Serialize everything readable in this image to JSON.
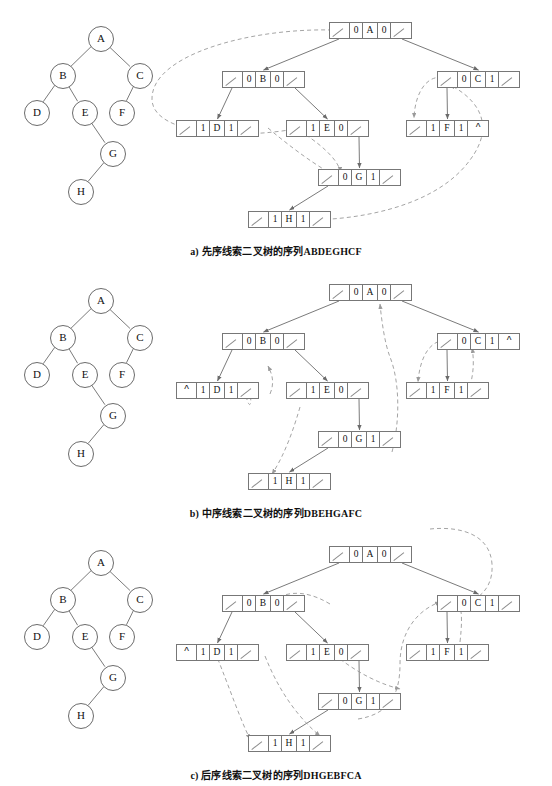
{
  "figure": {
    "title_visible": false,
    "colors": {
      "stroke": "#6b6b6b",
      "box_stroke": "#777777",
      "thread_dash": "#9a9a9a",
      "text": "#111111",
      "background": "#ffffff"
    }
  },
  "tree": {
    "description": "binary tree used by all three panels",
    "nodes": [
      {
        "id": "A",
        "label": "A",
        "x": 100,
        "y": 38
      },
      {
        "id": "B",
        "label": "B",
        "x": 62,
        "y": 75
      },
      {
        "id": "C",
        "label": "C",
        "x": 139,
        "y": 75
      },
      {
        "id": "D",
        "label": "D",
        "x": 36,
        "y": 112
      },
      {
        "id": "E",
        "label": "E",
        "x": 84,
        "y": 112
      },
      {
        "id": "F",
        "label": "F",
        "x": 121,
        "y": 112
      },
      {
        "id": "G",
        "label": "G",
        "x": 112,
        "y": 153
      },
      {
        "id": "H",
        "label": "H",
        "x": 80,
        "y": 191
      }
    ],
    "edges": [
      {
        "from": "A",
        "to": "B"
      },
      {
        "from": "A",
        "to": "C"
      },
      {
        "from": "B",
        "to": "D"
      },
      {
        "from": "B",
        "to": "E"
      },
      {
        "from": "C",
        "to": "F"
      },
      {
        "from": "E",
        "to": "G"
      },
      {
        "from": "G",
        "to": "H"
      }
    ]
  },
  "panels": [
    {
      "id": "a",
      "caption": "a) 先序线索二叉树的序列ABDEGHCF",
      "caption_y": 243,
      "records": [
        {
          "id": "A",
          "x": 329,
          "y": 22,
          "cells": [
            "/",
            "0",
            "A",
            "0",
            "/"
          ]
        },
        {
          "id": "B",
          "x": 222,
          "y": 71,
          "cells": [
            "/",
            "0",
            "B",
            "0",
            "/"
          ]
        },
        {
          "id": "C",
          "x": 437,
          "y": 71,
          "cells": [
            "/",
            "0",
            "C",
            "1",
            "/"
          ]
        },
        {
          "id": "D",
          "x": 176,
          "y": 120,
          "cells": [
            "/",
            "1",
            "D",
            "1",
            "/"
          ]
        },
        {
          "id": "E",
          "x": 286,
          "y": 120,
          "cells": [
            "/",
            "1",
            "E",
            "0",
            "/"
          ]
        },
        {
          "id": "F",
          "x": 406,
          "y": 120,
          "cells": [
            "/",
            "1",
            "F",
            "1",
            "^"
          ]
        },
        {
          "id": "G",
          "x": 318,
          "y": 169,
          "cells": [
            "/",
            "0",
            "G",
            "1",
            "/"
          ]
        },
        {
          "id": "H",
          "x": 248,
          "y": 211,
          "cells": [
            "/",
            "1",
            "H",
            "1",
            "/"
          ]
        }
      ]
    },
    {
      "id": "b",
      "caption": "b) 中序线索二叉树的序列DBEHGAFC",
      "caption_y": 243,
      "records": [
        {
          "id": "A",
          "x": 329,
          "y": 22,
          "cells": [
            "/",
            "0",
            "A",
            "0",
            "/"
          ]
        },
        {
          "id": "B",
          "x": 222,
          "y": 71,
          "cells": [
            "/",
            "0",
            "B",
            "0",
            "/"
          ]
        },
        {
          "id": "C",
          "x": 437,
          "y": 71,
          "cells": [
            "/",
            "0",
            "C",
            "1",
            "^"
          ]
        },
        {
          "id": "D",
          "x": 176,
          "y": 120,
          "cells": [
            "^",
            "1",
            "D",
            "1",
            "/"
          ]
        },
        {
          "id": "E",
          "x": 286,
          "y": 120,
          "cells": [
            "/",
            "1",
            "E",
            "0",
            "/"
          ]
        },
        {
          "id": "F",
          "x": 406,
          "y": 120,
          "cells": [
            "/",
            "1",
            "F",
            "1",
            "/"
          ]
        },
        {
          "id": "G",
          "x": 318,
          "y": 169,
          "cells": [
            "/",
            "0",
            "G",
            "1",
            "/"
          ]
        },
        {
          "id": "H",
          "x": 248,
          "y": 211,
          "cells": [
            "/",
            "1",
            "H",
            "1",
            "/"
          ]
        }
      ]
    },
    {
      "id": "c",
      "caption": "c) 后序线索二叉树的序列DHGEBFCA",
      "caption_y": 243,
      "records": [
        {
          "id": "A",
          "x": 329,
          "y": 22,
          "cells": [
            "/",
            "0",
            "A",
            "0",
            "/"
          ]
        },
        {
          "id": "B",
          "x": 222,
          "y": 71,
          "cells": [
            "/",
            "0",
            "B",
            "0",
            "/"
          ]
        },
        {
          "id": "C",
          "x": 437,
          "y": 71,
          "cells": [
            "/",
            "0",
            "C",
            "1",
            "/"
          ]
        },
        {
          "id": "D",
          "x": 176,
          "y": 120,
          "cells": [
            "^",
            "1",
            "D",
            "1",
            "/"
          ]
        },
        {
          "id": "E",
          "x": 286,
          "y": 120,
          "cells": [
            "/",
            "1",
            "E",
            "0",
            "/"
          ]
        },
        {
          "id": "F",
          "x": 406,
          "y": 120,
          "cells": [
            "/",
            "1",
            "F",
            "1",
            "/"
          ]
        },
        {
          "id": "G",
          "x": 318,
          "y": 169,
          "cells": [
            "/",
            "0",
            "G",
            "1",
            "/"
          ]
        },
        {
          "id": "H",
          "x": 248,
          "y": 211,
          "cells": [
            "/",
            "1",
            "H",
            "1",
            "/"
          ]
        }
      ]
    }
  ],
  "chart_data": {
    "type": "diagram",
    "subtype": "threaded-binary-tree",
    "tree_edges": [
      [
        "A",
        "B"
      ],
      [
        "A",
        "C"
      ],
      [
        "B",
        "D"
      ],
      [
        "B",
        "E"
      ],
      [
        "C",
        "F"
      ],
      [
        "E",
        "G"
      ],
      [
        "G",
        "H"
      ]
    ],
    "node_record_format": [
      "lchild",
      "ltag",
      "data",
      "rtag",
      "rchild"
    ],
    "traversals": {
      "preorder": "ABDEGHCF",
      "inorder": "DBEHGAFC",
      "postorder": "DHGEBFCA"
    }
  }
}
